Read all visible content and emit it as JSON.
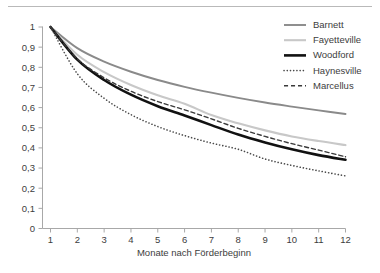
{
  "chart_data": {
    "type": "line",
    "title": "",
    "subtitle": "",
    "xlabel": "Monate nach Förderbeginn",
    "ylabel": "",
    "xlim": [
      1,
      12
    ],
    "ylim": [
      0,
      1
    ],
    "grid": false,
    "legend_position": "top-right",
    "x": [
      1,
      2,
      3,
      4,
      5,
      6,
      7,
      8,
      9,
      10,
      11,
      12
    ],
    "xticks": [
      "1",
      "2",
      "3",
      "4",
      "5",
      "6",
      "7",
      "8",
      "9",
      "10",
      "11",
      "12"
    ],
    "yticks": [
      "0",
      "0,1",
      "0,2",
      "0,3",
      "0,4",
      "0,5",
      "0,6",
      "0,7",
      "0,8",
      "0,9",
      "1"
    ],
    "ytick_values": [
      0,
      0.1,
      0.2,
      0.3,
      0.4,
      0.5,
      0.6,
      0.7,
      0.8,
      0.9,
      1
    ],
    "series": [
      {
        "name": "Barnett",
        "color": "#8a8a8a",
        "style": "solid",
        "width": 1.9,
        "values": [
          1.0,
          0.895,
          0.828,
          0.778,
          0.737,
          0.703,
          0.674,
          0.648,
          0.625,
          0.605,
          0.586,
          0.568
        ]
      },
      {
        "name": "Fayetteville",
        "color": "#c8c8c8",
        "style": "solid",
        "width": 2.1,
        "values": [
          1.0,
          0.862,
          0.776,
          0.712,
          0.661,
          0.619,
          0.563,
          0.522,
          0.487,
          0.457,
          0.434,
          0.414
        ]
      },
      {
        "name": "Woodford",
        "color": "#111111",
        "style": "solid",
        "width": 2.6,
        "values": [
          1.0,
          0.838,
          0.737,
          0.664,
          0.607,
          0.561,
          0.513,
          0.466,
          0.427,
          0.393,
          0.364,
          0.341
        ]
      },
      {
        "name": "Haynesville",
        "color": "#4a4a4a",
        "style": "dotted",
        "width": 1.6,
        "values": [
          1.0,
          0.768,
          0.646,
          0.565,
          0.506,
          0.461,
          0.424,
          0.393,
          0.345,
          0.313,
          0.286,
          0.261
        ]
      },
      {
        "name": "Marcellus",
        "color": "#3a3a3a",
        "style": "dashed",
        "width": 1.4,
        "values": [
          1.0,
          0.842,
          0.748,
          0.681,
          0.63,
          0.589,
          0.544,
          0.497,
          0.457,
          0.421,
          0.389,
          0.356
        ]
      }
    ]
  }
}
